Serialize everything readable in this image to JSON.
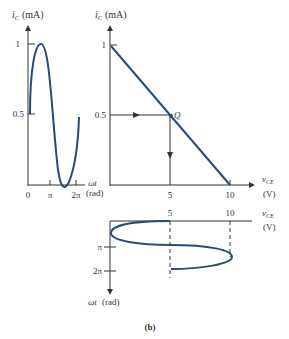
{
  "figure_label": "(b)",
  "colors": {
    "curve": "#2a4a7a",
    "axis": "#333333"
  },
  "left_plot": {
    "ylabel_main": "i",
    "ylabel_sub": "C",
    "ylabel_unit": "(mA)",
    "yticks": [
      "1",
      "0.5"
    ],
    "xticks": [
      "0",
      "π",
      "2π"
    ],
    "xlabel": "ωt",
    "xlabel_unit": "(rad)"
  },
  "right_plot": {
    "ylabel_main": "i",
    "ylabel_sub": "C",
    "ylabel_unit": "(mA)",
    "yticks": [
      "1",
      "0.5"
    ],
    "xticks": [
      "5",
      "10"
    ],
    "xlabel_main": "v",
    "xlabel_sub": "CE",
    "xlabel_unit": "(V)",
    "point_label": "Q"
  },
  "bottom_plot": {
    "xticks": [
      "5",
      "10"
    ],
    "xlabel_main": "v",
    "xlabel_sub": "CE",
    "xlabel_unit": "(V)",
    "yticks": [
      "π",
      "2π"
    ],
    "ylabel": "ωt",
    "ylabel_unit": "(rad)"
  }
}
